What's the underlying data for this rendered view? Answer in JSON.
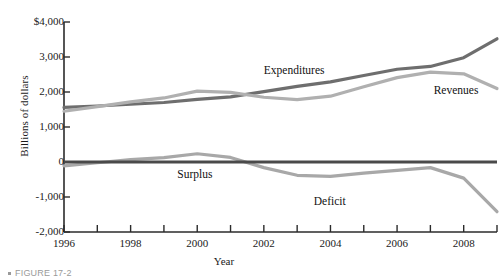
{
  "chart_data": {
    "type": "line",
    "title": "",
    "xlabel": "Year",
    "ylabel": "Billions of dollars",
    "xlim": [
      1996,
      2009
    ],
    "ylim": [
      -2000,
      4000
    ],
    "grid": false,
    "legend_position": "inline-annotations",
    "y_ticks": [
      "$4,000",
      "3,000",
      "2,000",
      "1,000",
      "0",
      "-1,000",
      "-2,000"
    ],
    "y_tick_values": [
      4000,
      3000,
      2000,
      1000,
      0,
      -1000,
      -2000
    ],
    "x_ticks": [
      "1996",
      "1998",
      "2000",
      "2002",
      "2004",
      "2006",
      "2008"
    ],
    "x_tick_values": [
      1996,
      1998,
      2000,
      2002,
      2004,
      2006,
      2008
    ],
    "x_minor_tick_values": [
      1997,
      1999,
      2001,
      2003,
      2005,
      2007,
      2009
    ],
    "x": [
      1996,
      1997,
      1998,
      1999,
      2000,
      2001,
      2002,
      2003,
      2004,
      2005,
      2006,
      2007,
      2008,
      2009
    ],
    "series": [
      {
        "name": "Expenditures",
        "color": "#6e6e6e",
        "width": 3.2,
        "values": [
          1560,
          1600,
          1650,
          1700,
          1790,
          1860,
          2010,
          2160,
          2290,
          2470,
          2650,
          2730,
          2980,
          3520
        ]
      },
      {
        "name": "Revenues",
        "color": "#b0b0b0",
        "width": 3.2,
        "values": [
          1450,
          1580,
          1720,
          1830,
          2025,
          1990,
          1850,
          1780,
          1880,
          2150,
          2410,
          2570,
          2520,
          2100
        ]
      },
      {
        "name": "Surplus/Deficit",
        "color": "#a8a8a8",
        "width": 3.2,
        "values": [
          -110,
          -22,
          70,
          125,
          235,
          130,
          -160,
          -380,
          -410,
          -320,
          -240,
          -160,
          -460,
          -1420
        ]
      }
    ],
    "annotations": [
      {
        "text": "Expenditures",
        "x": 2002.0,
        "y": 2620
      },
      {
        "text": "Revenues",
        "x": 2007.1,
        "y": 2070
      },
      {
        "text": "Surplus",
        "x": 1999.4,
        "y": -330
      },
      {
        "text": "Deficit",
        "x": 2003.5,
        "y": -1120
      }
    ],
    "zero_line": {
      "value": 0,
      "color": "#4a4a4a",
      "width": 3.2
    }
  },
  "caption": {
    "text": "FIGURE 17-2"
  }
}
